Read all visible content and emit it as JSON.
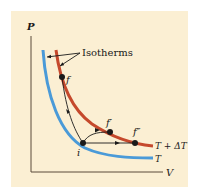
{
  "diagram": {
    "axes": {
      "y_label": "P",
      "x_label": "V"
    },
    "callout": {
      "label": "Isotherms"
    },
    "isotherms": [
      {
        "name": "T",
        "label": "T",
        "color": "#4a9ad8"
      },
      {
        "name": "T+dT",
        "label": "T + ΔT",
        "color": "#c5492c"
      }
    ],
    "points": {
      "i": "i",
      "f": "f",
      "f_prime": "f′",
      "f_double_prime": "f″"
    },
    "colors": {
      "background": "#fbefd3",
      "axis": "#5a4a3a",
      "path": "#1a1a1a"
    }
  }
}
